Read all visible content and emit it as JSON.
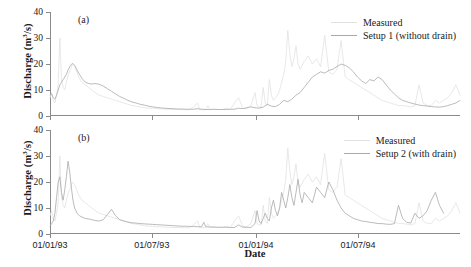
{
  "figure": {
    "xaxis_title": "Date",
    "yaxis_title_main": "Discharge (m",
    "yaxis_title_sup": "3",
    "yaxis_title_tail": "/s)"
  },
  "panels": [
    {
      "tag": "(a)",
      "legend": [
        {
          "name": "measured-series",
          "label": "Measured",
          "color": "#e2e2e2"
        },
        {
          "name": "setup1-series",
          "label": "Setup 1 (without drain)",
          "color": "#a9a9a9"
        }
      ]
    },
    {
      "tag": "(b)",
      "legend": [
        {
          "name": "measured-series",
          "label": "Measured",
          "color": "#e2e2e2"
        },
        {
          "name": "setup2-series",
          "label": "Setup 2 (with drain)",
          "color": "#a9a9a9"
        }
      ]
    }
  ],
  "chart_data": [
    {
      "type": "line",
      "panel": "(a)",
      "title": "",
      "xlabel": "Date",
      "ylabel": "Discharge (m3/s)",
      "ylim": [
        0,
        40
      ],
      "yticks": [
        0,
        10,
        20,
        30,
        40
      ],
      "xlim": [
        "01/01/93",
        "31/12/94"
      ],
      "xticks": [
        "01/01/93",
        "01/07/93",
        "01/01/94",
        "01/07/94"
      ],
      "xtick_positions": [
        0,
        0.2485,
        0.5027,
        0.7512
      ],
      "grid": false,
      "legend_position": "top-right",
      "series": [
        {
          "name": "Measured",
          "color": "#e2e2e2",
          "x": [
            0,
            0.004,
            0.008,
            0.012,
            0.016,
            0.02,
            0.024,
            0.028,
            0.032,
            0.036,
            0.04,
            0.045,
            0.05,
            0.055,
            0.06,
            0.065,
            0.07,
            0.078,
            0.086,
            0.094,
            0.102,
            0.11,
            0.12,
            0.13,
            0.14,
            0.15,
            0.16,
            0.17,
            0.18,
            0.19,
            0.2,
            0.21,
            0.22,
            0.23,
            0.24,
            0.25,
            0.26,
            0.27,
            0.28,
            0.29,
            0.3,
            0.31,
            0.32,
            0.33,
            0.34,
            0.35,
            0.36,
            0.365,
            0.37,
            0.375,
            0.38,
            0.385,
            0.39,
            0.4,
            0.41,
            0.42,
            0.43,
            0.44,
            0.45,
            0.46,
            0.47,
            0.48,
            0.49,
            0.5,
            0.505,
            0.51,
            0.515,
            0.52,
            0.525,
            0.53,
            0.535,
            0.54,
            0.545,
            0.55,
            0.555,
            0.56,
            0.565,
            0.57,
            0.575,
            0.58,
            0.585,
            0.59,
            0.595,
            0.6,
            0.605,
            0.61,
            0.62,
            0.63,
            0.64,
            0.65,
            0.66,
            0.67,
            0.68,
            0.69,
            0.7,
            0.71,
            0.72,
            0.73,
            0.74,
            0.75,
            0.76,
            0.77,
            0.78,
            0.79,
            0.8,
            0.81,
            0.82,
            0.83,
            0.84,
            0.85,
            0.86,
            0.87,
            0.88,
            0.89,
            0.9,
            0.91,
            0.92,
            0.93,
            0.94,
            0.95,
            0.96,
            0.97,
            0.98,
            0.99,
            1.0
          ],
          "y": [
            7,
            9,
            6,
            5,
            8,
            12,
            30,
            14,
            11,
            10,
            13,
            16,
            18,
            20,
            19,
            17,
            15,
            13,
            12,
            11,
            10,
            9,
            8,
            7.5,
            7,
            6.5,
            6,
            5.5,
            5,
            4.5,
            4,
            3.8,
            3.5,
            3.2,
            3,
            3,
            2.8,
            2.8,
            2.6,
            2.6,
            2.5,
            2.5,
            2.5,
            2.4,
            2.4,
            3.5,
            5,
            2.5,
            2.4,
            2.4,
            2.4,
            4,
            2.5,
            2.5,
            2.5,
            2.5,
            3,
            2.5,
            5,
            7,
            3,
            2.8,
            4,
            9,
            4,
            3.5,
            3.5,
            11,
            5,
            4,
            14,
            8,
            6,
            7,
            8,
            10,
            13,
            16,
            21,
            33,
            24,
            19,
            22,
            27,
            20,
            18,
            21,
            23,
            20,
            22,
            19,
            31,
            17,
            16,
            18,
            29,
            15,
            14,
            13,
            12,
            11,
            10,
            9,
            8,
            7,
            6,
            5.5,
            5,
            4.5,
            4,
            4,
            3.8,
            3.5,
            4,
            12,
            5,
            4,
            4,
            6,
            5,
            6,
            7,
            9,
            12,
            8,
            7
          ]
        },
        {
          "name": "Setup 1 (without drain)",
          "color": "#a9a9a9",
          "x": [
            0,
            0.004,
            0.008,
            0.012,
            0.016,
            0.02,
            0.024,
            0.028,
            0.032,
            0.036,
            0.04,
            0.045,
            0.05,
            0.055,
            0.06,
            0.065,
            0.07,
            0.078,
            0.086,
            0.094,
            0.102,
            0.11,
            0.12,
            0.13,
            0.14,
            0.15,
            0.16,
            0.17,
            0.18,
            0.19,
            0.2,
            0.21,
            0.22,
            0.23,
            0.24,
            0.25,
            0.26,
            0.27,
            0.28,
            0.29,
            0.3,
            0.31,
            0.32,
            0.33,
            0.34,
            0.35,
            0.36,
            0.37,
            0.38,
            0.39,
            0.4,
            0.41,
            0.42,
            0.43,
            0.44,
            0.45,
            0.46,
            0.47,
            0.48,
            0.49,
            0.5,
            0.51,
            0.52,
            0.53,
            0.54,
            0.55,
            0.56,
            0.57,
            0.58,
            0.59,
            0.6,
            0.61,
            0.62,
            0.63,
            0.64,
            0.65,
            0.66,
            0.67,
            0.68,
            0.69,
            0.7,
            0.71,
            0.72,
            0.73,
            0.74,
            0.75,
            0.76,
            0.77,
            0.78,
            0.79,
            0.8,
            0.81,
            0.82,
            0.83,
            0.84,
            0.85,
            0.86,
            0.87,
            0.88,
            0.89,
            0.9,
            0.91,
            0.92,
            0.93,
            0.94,
            0.95,
            0.96,
            0.97,
            0.98,
            0.99,
            1.0
          ],
          "y": [
            8,
            8.5,
            7,
            6.5,
            8,
            10,
            12,
            13,
            14,
            15,
            16,
            18,
            19.5,
            20.3,
            19.5,
            18,
            16.5,
            14.5,
            13,
            12.5,
            12.3,
            12.5,
            12.2,
            11.5,
            10.5,
            9.5,
            8.5,
            7.5,
            6.8,
            6,
            5.4,
            5,
            4.5,
            4.2,
            3.8,
            3.5,
            3.3,
            3.1,
            3,
            2.9,
            2.8,
            2.7,
            2.7,
            2.6,
            2.6,
            2.6,
            2.8,
            2.6,
            2.5,
            2.5,
            2.6,
            2.5,
            2.5,
            2.5,
            2.6,
            2.6,
            3,
            2.8,
            3.2,
            3.5,
            3.2,
            3,
            3.4,
            4.5,
            3.8,
            3.6,
            4.5,
            6,
            5.5,
            6.5,
            8,
            9,
            11,
            13,
            15,
            16,
            17,
            16.5,
            17.5,
            18,
            19,
            20,
            19.5,
            18.5,
            17,
            15,
            13.5,
            12.5,
            14,
            13.5,
            15,
            14,
            12,
            10,
            8.5,
            7,
            6,
            5.5,
            5,
            4.6,
            4.2,
            4,
            3.8,
            3.6,
            3.5,
            3.4,
            3.6,
            4,
            4.5,
            5,
            6,
            7
          ]
        }
      ]
    },
    {
      "type": "line",
      "panel": "(b)",
      "title": "",
      "xlabel": "Date",
      "ylabel": "Discharge (m3/s)",
      "ylim": [
        0,
        40
      ],
      "yticks": [
        0,
        10,
        20,
        30,
        40
      ],
      "xlim": [
        "01/01/93",
        "31/12/94"
      ],
      "xticks": [
        "01/01/93",
        "01/07/93",
        "01/01/94",
        "01/07/94"
      ],
      "xtick_positions": [
        0,
        0.2485,
        0.5027,
        0.7512
      ],
      "grid": false,
      "legend_position": "top-right",
      "series": [
        {
          "name": "Measured",
          "color": "#e2e2e2",
          "x": [
            0,
            0.004,
            0.008,
            0.012,
            0.016,
            0.02,
            0.024,
            0.028,
            0.032,
            0.036,
            0.04,
            0.045,
            0.05,
            0.055,
            0.06,
            0.065,
            0.07,
            0.078,
            0.086,
            0.094,
            0.102,
            0.11,
            0.12,
            0.13,
            0.14,
            0.15,
            0.16,
            0.17,
            0.18,
            0.19,
            0.2,
            0.21,
            0.22,
            0.23,
            0.24,
            0.25,
            0.26,
            0.27,
            0.28,
            0.29,
            0.3,
            0.31,
            0.32,
            0.33,
            0.34,
            0.35,
            0.36,
            0.365,
            0.37,
            0.375,
            0.38,
            0.385,
            0.39,
            0.4,
            0.41,
            0.42,
            0.43,
            0.44,
            0.45,
            0.46,
            0.47,
            0.48,
            0.49,
            0.5,
            0.505,
            0.51,
            0.515,
            0.52,
            0.525,
            0.53,
            0.535,
            0.54,
            0.545,
            0.55,
            0.555,
            0.56,
            0.565,
            0.57,
            0.575,
            0.58,
            0.585,
            0.59,
            0.595,
            0.6,
            0.605,
            0.61,
            0.62,
            0.63,
            0.64,
            0.65,
            0.66,
            0.67,
            0.68,
            0.69,
            0.7,
            0.71,
            0.72,
            0.73,
            0.74,
            0.75,
            0.76,
            0.77,
            0.78,
            0.79,
            0.8,
            0.81,
            0.82,
            0.83,
            0.84,
            0.85,
            0.86,
            0.87,
            0.88,
            0.89,
            0.9,
            0.91,
            0.92,
            0.93,
            0.94,
            0.95,
            0.96,
            0.97,
            0.98,
            0.99,
            1.0
          ],
          "y": [
            7,
            9,
            6,
            5,
            8,
            12,
            30,
            14,
            11,
            10,
            13,
            16,
            18,
            20,
            19,
            17,
            15,
            13,
            12,
            11,
            10,
            9,
            8,
            7.5,
            7,
            6.5,
            6,
            5.5,
            5,
            4.5,
            4,
            3.8,
            3.5,
            3.2,
            3,
            3,
            2.8,
            2.8,
            2.6,
            2.6,
            2.5,
            2.5,
            2.5,
            2.4,
            2.4,
            3.5,
            5,
            2.5,
            2.4,
            2.4,
            2.4,
            4,
            2.5,
            2.5,
            2.5,
            2.5,
            3,
            2.5,
            5,
            7,
            3,
            2.8,
            4,
            9,
            4,
            3.5,
            3.5,
            11,
            5,
            4,
            14,
            8,
            6,
            7,
            8,
            10,
            13,
            16,
            21,
            33,
            24,
            19,
            22,
            27,
            20,
            18,
            21,
            23,
            20,
            22,
            19,
            31,
            17,
            16,
            18,
            29,
            15,
            14,
            13,
            12,
            11,
            10,
            9,
            8,
            7,
            6,
            5.5,
            5,
            4.5,
            4,
            4,
            3.8,
            3.5,
            4,
            12,
            5,
            4,
            4,
            6,
            5,
            6,
            7,
            9,
            12,
            8,
            7
          ]
        },
        {
          "name": "Setup 2 (with drain)",
          "color": "#a9a9a9",
          "x": [
            0,
            0.004,
            0.008,
            0.012,
            0.016,
            0.02,
            0.024,
            0.028,
            0.032,
            0.036,
            0.04,
            0.044,
            0.048,
            0.052,
            0.056,
            0.06,
            0.066,
            0.072,
            0.078,
            0.086,
            0.094,
            0.102,
            0.11,
            0.12,
            0.13,
            0.14,
            0.15,
            0.16,
            0.17,
            0.18,
            0.19,
            0.2,
            0.21,
            0.22,
            0.23,
            0.24,
            0.25,
            0.26,
            0.27,
            0.28,
            0.29,
            0.3,
            0.31,
            0.32,
            0.33,
            0.34,
            0.35,
            0.36,
            0.37,
            0.375,
            0.38,
            0.39,
            0.4,
            0.41,
            0.42,
            0.43,
            0.44,
            0.45,
            0.46,
            0.47,
            0.48,
            0.49,
            0.5,
            0.505,
            0.51,
            0.515,
            0.52,
            0.525,
            0.53,
            0.535,
            0.54,
            0.545,
            0.55,
            0.555,
            0.56,
            0.565,
            0.57,
            0.575,
            0.58,
            0.585,
            0.59,
            0.595,
            0.6,
            0.605,
            0.61,
            0.615,
            0.62,
            0.63,
            0.64,
            0.65,
            0.66,
            0.67,
            0.68,
            0.69,
            0.7,
            0.71,
            0.72,
            0.73,
            0.74,
            0.75,
            0.76,
            0.77,
            0.78,
            0.79,
            0.8,
            0.81,
            0.82,
            0.83,
            0.84,
            0.85,
            0.86,
            0.87,
            0.88,
            0.89,
            0.9,
            0.91,
            0.92,
            0.93,
            0.94,
            0.95,
            0.96,
            0.97,
            0.98,
            0.99,
            1.0
          ],
          "y": [
            3,
            4,
            5,
            8,
            14,
            20,
            22,
            16,
            13,
            17,
            22,
            28,
            24,
            18,
            13,
            10,
            8,
            7,
            6.5,
            6,
            5.8,
            5.5,
            5.2,
            5,
            5.5,
            7.5,
            9.5,
            7,
            5.5,
            5,
            4.6,
            4.3,
            4.2,
            4,
            3.9,
            3.8,
            3.7,
            3.6,
            3.5,
            3.4,
            3.3,
            3.2,
            3.1,
            3,
            3,
            2.9,
            2.9,
            2.8,
            2.8,
            4.5,
            2.8,
            2.7,
            2.7,
            2.6,
            2.6,
            2.6,
            2.5,
            2.5,
            3.5,
            2.6,
            2.6,
            2.5,
            4,
            9,
            5,
            4,
            6,
            8,
            6,
            5,
            10,
            13,
            9,
            7,
            10,
            16,
            13,
            10,
            14,
            19,
            14,
            11,
            16,
            21,
            15,
            12,
            16,
            14,
            12,
            18,
            16,
            14,
            20,
            17,
            13,
            10,
            8,
            7,
            6,
            5.5,
            5,
            4.8,
            4.5,
            4.3,
            4,
            4,
            3.8,
            3.7,
            4,
            11,
            6,
            4.5,
            4.2,
            8,
            6,
            7,
            9,
            13,
            16,
            11,
            8
          ]
        }
      ]
    }
  ]
}
